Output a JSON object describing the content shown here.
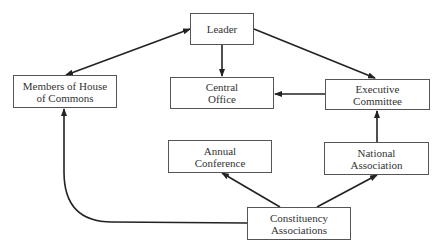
{
  "diagram": {
    "type": "flowchart",
    "nodes": {
      "leader": {
        "line1": "Leader",
        "line2": ""
      },
      "members": {
        "line1": "Members of House",
        "line2": "of Commons"
      },
      "central_office": {
        "line1": "Central",
        "line2": "Office"
      },
      "executive": {
        "line1": "Executive",
        "line2": "Committee"
      },
      "annual": {
        "line1": "Annual",
        "line2": "Conference"
      },
      "national": {
        "line1": "National",
        "line2": "Association"
      },
      "constituency": {
        "line1": "Constituency",
        "line2": "Associations"
      }
    },
    "edges": [
      {
        "from": "Leader",
        "to": "Members of House of Commons",
        "direction": "bidirectional"
      },
      {
        "from": "Leader",
        "to": "Central Office",
        "direction": "forward"
      },
      {
        "from": "Leader",
        "to": "Executive Committee",
        "direction": "forward"
      },
      {
        "from": "Executive Committee",
        "to": "Central Office",
        "direction": "forward"
      },
      {
        "from": "National Association",
        "to": "Executive Committee",
        "direction": "forward"
      },
      {
        "from": "Constituency Associations",
        "to": "Annual Conference",
        "direction": "forward"
      },
      {
        "from": "Constituency Associations",
        "to": "National Association",
        "direction": "forward"
      },
      {
        "from": "Constituency Associations",
        "to": "Members of House of Commons",
        "direction": "forward"
      }
    ],
    "colors": {
      "line": "#222222",
      "box_border": "#555555",
      "text": "#333333",
      "background": "#ffffff"
    }
  }
}
